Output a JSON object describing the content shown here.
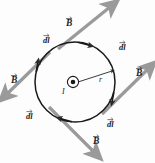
{
  "figure": {
    "name": "amperian-loop-diagram",
    "colors": {
      "loop": "#1a1a1a",
      "field_arrow": "#9a9a9a",
      "field_arrow_dark": "#7d7d7d",
      "label": "#1d1d1d",
      "background": "#ffffff"
    },
    "center": {
      "cx": 75,
      "cy": 82,
      "radius": 40
    }
  },
  "labels": {
    "current": "I",
    "radius": "r",
    "field_top": "B",
    "field_left": "B",
    "field_right": "B",
    "field_bottom": "B",
    "element_top_left": "dl",
    "element_top_right": "dl",
    "element_bottom_left": "dl",
    "element_bottom_right": "dl"
  },
  "symbols": {
    "current_out_of_page": "dot-in-circle-icon",
    "vector_arrow": "vector-overbar-icon"
  },
  "field_vectors": [
    {
      "id": "field-top",
      "label": "B",
      "direction": "up-right",
      "x1": 60,
      "y1": 47,
      "x2": 108,
      "y2": 8
    },
    {
      "id": "field-left",
      "label": "B",
      "direction": "down-left",
      "x1": 48,
      "y1": 53,
      "x2": 8,
      "y2": 92
    },
    {
      "id": "field-right",
      "label": "B",
      "direction": "up-right",
      "x1": 104,
      "y1": 112,
      "x2": 146,
      "y2": 70
    },
    {
      "id": "field-bottom",
      "label": "B",
      "direction": "down-right",
      "x1": 50,
      "y1": 108,
      "x2": 92,
      "y2": 150
    }
  ],
  "line_elements": [
    {
      "id": "dl-top-left",
      "label": "dl",
      "x": 47,
      "y": 36
    },
    {
      "id": "dl-top-right",
      "label": "dl",
      "x": 122,
      "y": 42
    },
    {
      "id": "dl-bottom-left",
      "label": "dl",
      "x": 28,
      "y": 112
    },
    {
      "id": "dl-bottom-right",
      "label": "dl",
      "x": 110,
      "y": 120
    }
  ],
  "loop_direction": "counterclockwise-arrowheads-on-circle"
}
